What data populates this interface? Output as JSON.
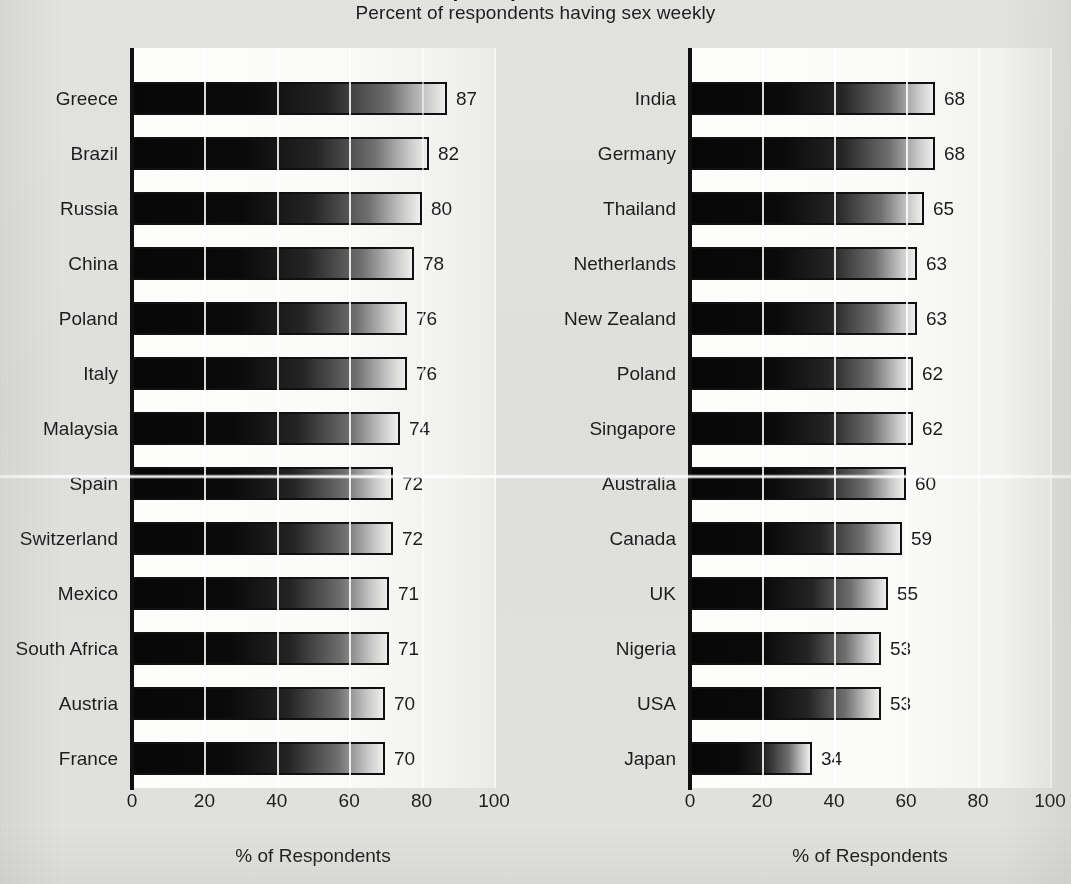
{
  "header": {
    "title": "Sex Frequency Around the Globe",
    "subtitle": "Percent of respondents having sex weekly"
  },
  "axis": {
    "ticks": [
      "0",
      "20",
      "40",
      "60",
      "80",
      "100"
    ],
    "tick_values": [
      0,
      20,
      40,
      60,
      80,
      100
    ],
    "x_title": "% of Respondents",
    "xlim": [
      0,
      100
    ]
  },
  "chart_data": {
    "type": "bar",
    "orientation": "horizontal",
    "title": "Sex Frequency Around the Globe",
    "subtitle": "Percent of respondents having sex weekly",
    "xlabel": "% of Respondents",
    "ylabel": "",
    "xlim": [
      0,
      100
    ],
    "grid": "vertical",
    "legend": "none",
    "panels": [
      {
        "name": "left-panel",
        "categories": [
          "Greece",
          "Brazil",
          "Russia",
          "China",
          "Poland",
          "Italy",
          "Malaysia",
          "Spain",
          "Switzerland",
          "Mexico",
          "South Africa",
          "Austria",
          "France"
        ],
        "values": [
          87,
          82,
          80,
          78,
          76,
          76,
          74,
          72,
          72,
          71,
          71,
          70,
          70
        ]
      },
      {
        "name": "right-panel",
        "categories": [
          "India",
          "Germany",
          "Thailand",
          "Netherlands",
          "New Zealand",
          "Poland",
          "Singapore",
          "Australia",
          "Canada",
          "UK",
          "Nigeria",
          "USA",
          "Japan"
        ],
        "values": [
          68,
          68,
          65,
          63,
          63,
          62,
          62,
          60,
          59,
          55,
          53,
          53,
          34
        ]
      }
    ]
  },
  "colors": {
    "page_background": "#e3e3e1",
    "plot_background": "#fcfcfb",
    "bar_dark": "#070707",
    "bar_light": "#eeeeec",
    "axis": "#101010",
    "text": "#1d1d1d"
  }
}
